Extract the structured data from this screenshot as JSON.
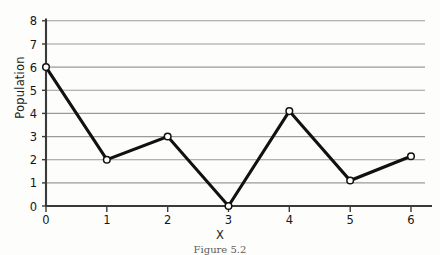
{
  "chart_data": {
    "type": "line",
    "title": "",
    "xlabel": "X",
    "ylabel": "Population",
    "x": [
      0,
      1,
      2,
      3,
      4,
      5,
      6
    ],
    "values": [
      6,
      2,
      3,
      0,
      4.1,
      1.1,
      2.15
    ],
    "series": [
      {
        "name": "Population",
        "values": [
          6,
          2,
          3,
          0,
          4.1,
          1.1,
          2.15
        ]
      }
    ],
    "xlim": [
      0,
      6.6
    ],
    "ylim": [
      0,
      8
    ],
    "xticks": [
      "0",
      "1",
      "2",
      "3",
      "4",
      "5",
      "6"
    ],
    "yticks": [
      "0",
      "1",
      "2",
      "3",
      "4",
      "5",
      "6",
      "7",
      "8"
    ],
    "grid": "horizontal",
    "legend": "none",
    "marker": "open-circle",
    "line_color": "#111111",
    "grid_color": "#9a9a9a",
    "axis_color": "#3a3a3a",
    "marker_fill": "#ffffff"
  },
  "figure": {
    "caption": "Figure 5.2"
  }
}
